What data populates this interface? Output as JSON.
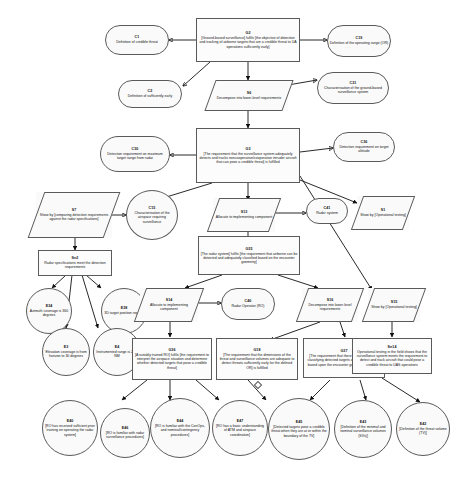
{
  "diagram": {
    "notation": "GSN",
    "nodes": [
      {
        "id": "C1",
        "type": "context",
        "label": "Definition of credible threat"
      },
      {
        "id": "G2",
        "type": "goal",
        "label": "[Ground-based surveillance] fulfils [the objective of detection and tracking of airborne targets that are a credible threat to UA operations sufficiently early]"
      },
      {
        "id": "C19",
        "type": "context",
        "label": "Definition of the operating range (OR)"
      },
      {
        "id": "C2",
        "type": "context",
        "label": "Definition of sufficiently early"
      },
      {
        "id": "S6",
        "type": "strategy",
        "label": "Decompose into lower-level requirements"
      },
      {
        "id": "C31",
        "type": "context",
        "label": "Characterisation of the ground-based surveillance system"
      },
      {
        "id": "C30",
        "type": "context",
        "label": "Detection requirement on maximum target range from radar"
      },
      {
        "id": "G3",
        "type": "goal",
        "label": "[The requirement that the surveillance system adequately detects and tracks noncooperative/cooperative intruder aircraft that can pose a credible threat] is fulfilled"
      },
      {
        "id": "C36",
        "type": "context",
        "label": "Detection requirement on target altitude"
      },
      {
        "id": "S7",
        "type": "strategy",
        "label": "Show by [comparing detection requirements against the radar specifications]"
      },
      {
        "id": "C15",
        "type": "justification",
        "label": "Characterisation of the airspace requiring surveillance"
      },
      {
        "id": "S13",
        "type": "strategy",
        "label": "Allocate to implementing component"
      },
      {
        "id": "C41",
        "type": "context",
        "label": "Radar system"
      },
      {
        "id": "S1",
        "type": "strategy",
        "label": "Show by [Operational testing]"
      },
      {
        "id": "Sn2",
        "type": "goal",
        "label": "Radar specifications meet the detection requirements"
      },
      {
        "id": "G35",
        "type": "goal",
        "label": "[The radar system] fulfils [the requirement that airborne can be detected and adequately classified based on the encounter geometry]"
      },
      {
        "id": "E34",
        "type": "solution",
        "label": "Azimuth coverage is 360 degrees"
      },
      {
        "id": "E38",
        "type": "solution",
        "label": "3D target position reports"
      },
      {
        "id": "E3",
        "type": "solution",
        "label": "Elevation coverage is from horizon to 30 degrees"
      },
      {
        "id": "E4",
        "type": "solution",
        "label": "Instrumented range is 21.5 NM"
      },
      {
        "id": "S14",
        "type": "strategy",
        "label": "Allocate to implementing component"
      },
      {
        "id": "C40",
        "type": "context",
        "label": "Radar Operator (RO)"
      },
      {
        "id": "S16",
        "type": "strategy",
        "label": "Decompose into lower-level requirements"
      },
      {
        "id": "S15",
        "type": "strategy",
        "label": "Show by [Operational testing]"
      },
      {
        "id": "G36",
        "type": "goal",
        "label": "[A suitably trained RO] fulfils [the requirement to interpret the airspace situation and determine whether detected targets that pose a credible threat]"
      },
      {
        "id": "G18",
        "type": "goal",
        "label": "[The requirement that the dimensions of the threat and surveillance volumes are adequate to detect threats sufficiently early for the defined OR] is fulfilled"
      },
      {
        "id": "G37",
        "type": "goal",
        "label": "[The requirement that there exists a basis for classifying detected targets as a credible threat based upon the encounter geometry] is fulfilled"
      },
      {
        "id": "Sn14",
        "type": "goal",
        "label": "Operational testing in the field shows that the surveillance system meets the requirement to detect and track aircraft that could pose a credible threat to UAS operations"
      },
      {
        "id": "E40",
        "type": "solution",
        "label": "[RO has received sufficient prior training on operating the radar system]"
      },
      {
        "id": "E46",
        "type": "solution",
        "label": "[RO is familiar with radar surveillance procedures]"
      },
      {
        "id": "E44",
        "type": "solution",
        "label": "[RO is familiar with the ConOps, and nominal/contingency procedures]"
      },
      {
        "id": "E47",
        "type": "solution",
        "label": "[RO has a basic understanding of ATM and airspace coordination]"
      },
      {
        "id": "E45",
        "type": "solution",
        "label": "[Detected targets pose a credible threat when they are at or within the boundary of the TV]"
      },
      {
        "id": "E43",
        "type": "solution",
        "label": "[Definition of the minimal and nominal surveillance volumes (SVs)]"
      },
      {
        "id": "E42",
        "type": "solution",
        "label": "[Definition of the threat volume (TV)]"
      }
    ]
  }
}
